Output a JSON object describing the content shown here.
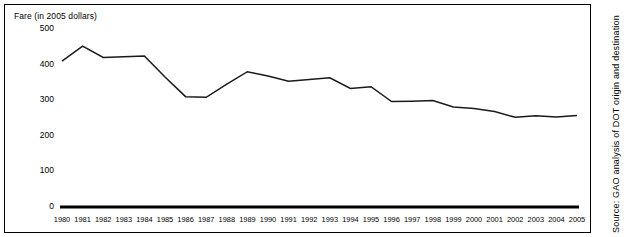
{
  "chart_data": {
    "type": "line",
    "title": "Fare (in 2005 dollars)",
    "xlabel": "",
    "ylabel": "Fare (in 2005 dollars)",
    "ylim": [
      0,
      500
    ],
    "yticks": [
      0,
      100,
      200,
      300,
      400,
      500
    ],
    "grid": false,
    "legend": "none",
    "categories": [
      "1980",
      "1981",
      "1982",
      "1983",
      "1984",
      "1985",
      "1986",
      "1987",
      "1988",
      "1989",
      "1990",
      "1991",
      "1992",
      "1993",
      "1994",
      "1995",
      "1996",
      "1997",
      "1998",
      "1999",
      "2000",
      "2001",
      "2002",
      "2003",
      "2004",
      "2005"
    ],
    "values": [
      410,
      452,
      420,
      422,
      424,
      365,
      310,
      308,
      345,
      380,
      368,
      353,
      358,
      363,
      333,
      338,
      296,
      297,
      299,
      281,
      277,
      268,
      252,
      256,
      253,
      257
    ],
    "series": [
      {
        "name": "Average fare",
        "values": [
          410,
          452,
          420,
          422,
          424,
          365,
          310,
          308,
          345,
          380,
          368,
          353,
          358,
          363,
          333,
          338,
          296,
          297,
          299,
          281,
          277,
          268,
          252,
          256,
          253,
          257
        ],
        "color": "#1a1a1a"
      }
    ],
    "xticklabels": [
      "1980",
      "1981",
      "1982",
      "1983",
      "1984",
      "1985",
      "1986",
      "1987",
      "1988",
      "1989",
      "1990",
      "1991",
      "1992",
      "1993",
      "1994",
      "1995",
      "1996",
      "1997",
      "1998",
      "1999",
      "2000",
      "2001",
      "2002",
      "2003",
      "2004",
      "2005"
    ],
    "yticklabels": [
      "0",
      "100",
      "200",
      "300",
      "400",
      "500"
    ]
  },
  "source": {
    "note": "Source: GAO analysis of DOT origin and destination"
  },
  "colors": {
    "line": "#1a1a1a",
    "axis": "#000000",
    "frame": "#000000",
    "background": "#ffffff"
  }
}
